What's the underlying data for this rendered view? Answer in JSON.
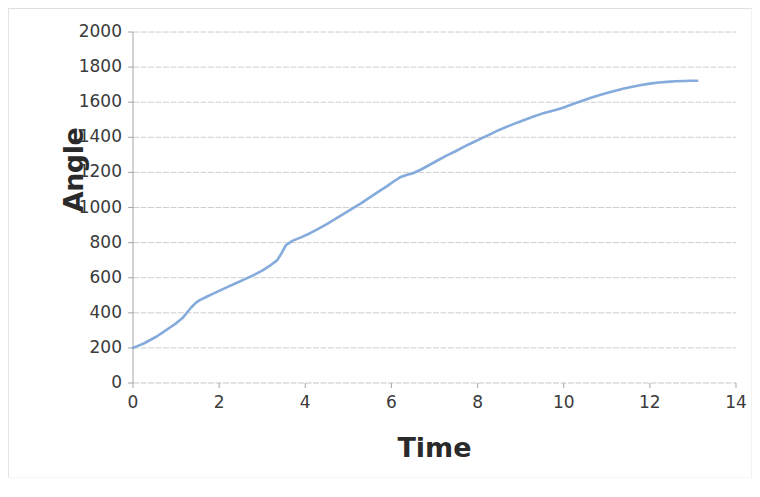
{
  "chart_data": {
    "type": "line",
    "title": "",
    "xlabel": "Time",
    "ylabel": "Angle",
    "xlim": [
      0,
      14
    ],
    "ylim": [
      0,
      2000
    ],
    "xticks": [
      "0",
      "2",
      "4",
      "6",
      "8",
      "10",
      "12",
      "14"
    ],
    "yticks": [
      "0",
      "200",
      "400",
      "600",
      "800",
      "1000",
      "1200",
      "1400",
      "1600",
      "1800",
      "2000"
    ],
    "grid": "horizontal",
    "legend": "none",
    "series": [
      {
        "name": "Angle vs Time",
        "color": "#7da7d9",
        "x": [
          0.0,
          0.1,
          0.25,
          0.4,
          0.55,
          0.7,
          0.85,
          1.0,
          1.15,
          1.25,
          1.35,
          1.45,
          1.55,
          1.7,
          1.85,
          2.0,
          2.2,
          2.4,
          2.6,
          2.8,
          3.0,
          3.2,
          3.35,
          3.45,
          3.55,
          3.7,
          3.9,
          4.1,
          4.3,
          4.5,
          4.7,
          4.9,
          5.1,
          5.3,
          5.5,
          5.7,
          5.9,
          6.05,
          6.2,
          6.35,
          6.5,
          6.7,
          6.9,
          7.1,
          7.3,
          7.5,
          7.7,
          7.9,
          8.1,
          8.3,
          8.5,
          8.7,
          8.9,
          9.1,
          9.3,
          9.5,
          9.7,
          9.85,
          10.0,
          10.2,
          10.4,
          10.6,
          10.8,
          11.0,
          11.2,
          11.4,
          11.6,
          11.8,
          12.0,
          12.2,
          12.4,
          12.6,
          12.8,
          12.95,
          13.1
        ],
        "y": [
          200,
          210,
          225,
          245,
          265,
          290,
          315,
          340,
          370,
          400,
          430,
          455,
          472,
          490,
          508,
          525,
          548,
          570,
          592,
          615,
          640,
          672,
          700,
          740,
          785,
          810,
          830,
          852,
          878,
          905,
          935,
          965,
          995,
          1025,
          1058,
          1090,
          1122,
          1148,
          1172,
          1185,
          1195,
          1218,
          1245,
          1272,
          1298,
          1322,
          1348,
          1372,
          1395,
          1418,
          1442,
          1462,
          1482,
          1500,
          1518,
          1535,
          1548,
          1558,
          1570,
          1588,
          1605,
          1622,
          1638,
          1652,
          1665,
          1678,
          1688,
          1698,
          1706,
          1712,
          1716,
          1719,
          1721,
          1722,
          1722
        ]
      }
    ]
  },
  "axes": {
    "grid_color": "#b8b8b8",
    "axis_color": "#9a9a9a",
    "plot_left": 133,
    "plot_right": 736,
    "plot_top": 32,
    "plot_bottom": 383
  }
}
